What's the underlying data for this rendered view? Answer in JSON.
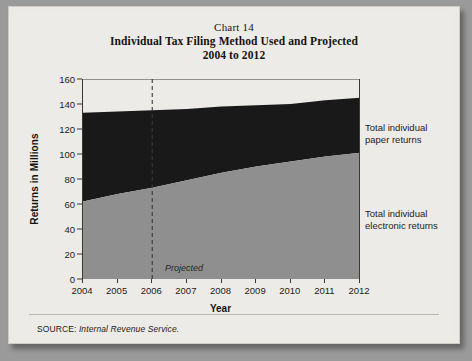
{
  "figure": {
    "chart_number": "Chart 14",
    "title": "Individual Tax Filing Method Used and Projected",
    "subtitle": "2004 to 2012",
    "source_label": "SOURCE:",
    "source_value": "Internal Revenue Service.",
    "projected_note": "Projected",
    "legend": {
      "paper_line1": "Total individual",
      "paper_line2": "paper returns",
      "electronic_line1": "Total individual",
      "electronic_line2": "electronic returns"
    },
    "colors": {
      "paper_fill": "#191919",
      "electronic_fill": "#8f8f8f",
      "background": "#edebe7",
      "axis": "#3a3835"
    }
  },
  "chart_data": {
    "type": "area",
    "stacked": true,
    "title": "Individual Tax Filing Method Used and Projected 2004 to 2012",
    "xlabel": "Year",
    "ylabel": "Returns in Millions",
    "x": [
      2004,
      2005,
      2006,
      2007,
      2008,
      2009,
      2010,
      2011,
      2012
    ],
    "xtick_labels": [
      "2004",
      "2005",
      "2006",
      "2007",
      "2008",
      "2009",
      "2010",
      "2011",
      "2012"
    ],
    "ytick_labels": [
      "0",
      "20",
      "40",
      "60",
      "80",
      "100",
      "120",
      "140",
      "160"
    ],
    "yticks": [
      0,
      20,
      40,
      60,
      80,
      100,
      120,
      140,
      160
    ],
    "ylim": [
      0,
      160
    ],
    "xlim": [
      2004,
      2012
    ],
    "grid": false,
    "legend_position": "right",
    "annotations": [
      {
        "text": "Projected",
        "x": 2006,
        "note": "dashed vertical divider at 2006 separating actual from projected"
      }
    ],
    "series": [
      {
        "name": "Total individual electronic returns",
        "color": "#8f8f8f",
        "values": [
          62,
          68,
          73,
          79,
          85,
          90,
          94,
          98,
          101
        ]
      },
      {
        "name": "Total individual paper returns",
        "color": "#191919",
        "values": [
          71,
          66,
          62,
          57,
          53,
          49,
          46,
          45,
          44
        ]
      }
    ],
    "totals": [
      133,
      134,
      135,
      136,
      138,
      139,
      140,
      143,
      145
    ]
  }
}
